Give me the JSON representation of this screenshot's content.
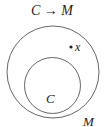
{
  "title": "C → M",
  "labels": {
    "outer": "M",
    "inner": "C",
    "point": "x"
  },
  "colors": {
    "stroke": "#555555",
    "text": "#222222"
  }
}
